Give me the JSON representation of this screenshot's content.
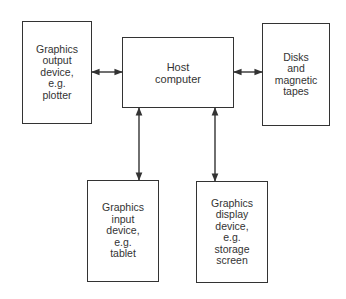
{
  "diagram": {
    "type": "block-diagram",
    "nodes": [
      {
        "id": "output",
        "label": "Graphics\noutput\ndevice,\ne.g.\nplotter"
      },
      {
        "id": "host",
        "label": "Host\ncomputer"
      },
      {
        "id": "storage",
        "label": "Disks\nand\nmagnetic\ntapes"
      },
      {
        "id": "input",
        "label": "Graphics\ninput\ndevice,\ne.g.\ntablet"
      },
      {
        "id": "display",
        "label": "Graphics\ndisplay\ndevice,\ne.g.\nstorage\nscreen"
      }
    ],
    "edges": [
      {
        "from": "output",
        "to": "host",
        "direction": "bidirectional"
      },
      {
        "from": "host",
        "to": "storage",
        "direction": "bidirectional"
      },
      {
        "from": "host",
        "to": "input",
        "direction": "bidirectional"
      },
      {
        "from": "host",
        "to": "display",
        "direction": "bidirectional"
      }
    ],
    "colors": {
      "line": "#333333",
      "background": "#ffffff"
    }
  }
}
